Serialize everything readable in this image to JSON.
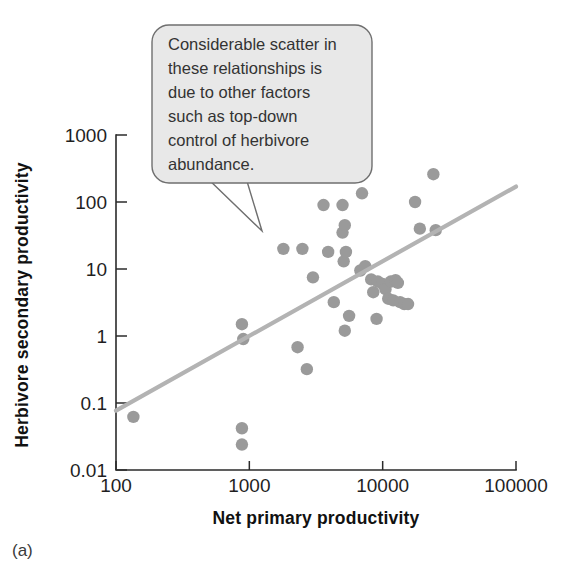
{
  "figure": {
    "panel_label": "(a)",
    "background_color": "#ffffff"
  },
  "callout": {
    "lines": [
      "Considerable scatter in",
      "these relationships is",
      "due to other factors",
      "such as top-down",
      "control of herbivore",
      "abundance."
    ],
    "text": "Considerable scatter in these relationships is due to other factors such as top-down control of herbivore abundance.",
    "fill_color": "#e8e8e8",
    "border_color": "#6f6f6f"
  },
  "chart_data": {
    "type": "scatter",
    "title": "",
    "xlabel": "Net primary productivity",
    "ylabel": "Herbivore secondary productivity",
    "xscale": "log",
    "yscale": "log",
    "xlim": [
      100,
      100000
    ],
    "ylim": [
      0.01,
      1000
    ],
    "xticks": [
      100,
      1000,
      10000,
      100000
    ],
    "xticklabels": [
      "100",
      "1000",
      "10000",
      "100000"
    ],
    "yticks": [
      0.01,
      0.1,
      1,
      10,
      100,
      1000
    ],
    "yticklabels": [
      "0.01",
      "0.1",
      "1",
      "10",
      "100",
      "1000"
    ],
    "grid": false,
    "legend": null,
    "marker_color": "#9a9a9a",
    "trendline": {
      "color": "#b3b3b3",
      "x": [
        100,
        100000
      ],
      "y": [
        0.077,
        170
      ]
    },
    "points": [
      {
        "x": 135,
        "y": 0.062
      },
      {
        "x": 880,
        "y": 1.5
      },
      {
        "x": 900,
        "y": 0.9
      },
      {
        "x": 880,
        "y": 0.042
      },
      {
        "x": 880,
        "y": 0.024
      },
      {
        "x": 1800,
        "y": 20
      },
      {
        "x": 2500,
        "y": 20
      },
      {
        "x": 2300,
        "y": 0.68
      },
      {
        "x": 2700,
        "y": 0.32
      },
      {
        "x": 3000,
        "y": 7.5
      },
      {
        "x": 3600,
        "y": 90
      },
      {
        "x": 3900,
        "y": 18
      },
      {
        "x": 4300,
        "y": 3.2
      },
      {
        "x": 5000,
        "y": 90
      },
      {
        "x": 5000,
        "y": 35
      },
      {
        "x": 5200,
        "y": 45
      },
      {
        "x": 5100,
        "y": 13
      },
      {
        "x": 5300,
        "y": 18
      },
      {
        "x": 5200,
        "y": 1.2
      },
      {
        "x": 5600,
        "y": 2.0
      },
      {
        "x": 7000,
        "y": 135
      },
      {
        "x": 6800,
        "y": 9.5
      },
      {
        "x": 7400,
        "y": 11
      },
      {
        "x": 8200,
        "y": 7.0
      },
      {
        "x": 8500,
        "y": 4.5
      },
      {
        "x": 9200,
        "y": 6.5
      },
      {
        "x": 9000,
        "y": 1.8
      },
      {
        "x": 10000,
        "y": 6.0
      },
      {
        "x": 10500,
        "y": 5.0
      },
      {
        "x": 11000,
        "y": 3.6
      },
      {
        "x": 11500,
        "y": 6.5
      },
      {
        "x": 12000,
        "y": 3.4
      },
      {
        "x": 12500,
        "y": 6.8
      },
      {
        "x": 13000,
        "y": 6.2
      },
      {
        "x": 13500,
        "y": 3.2
      },
      {
        "x": 14500,
        "y": 3.0
      },
      {
        "x": 15500,
        "y": 3.0
      },
      {
        "x": 17500,
        "y": 100
      },
      {
        "x": 19000,
        "y": 40
      },
      {
        "x": 24000,
        "y": 260
      },
      {
        "x": 25000,
        "y": 38
      }
    ]
  }
}
